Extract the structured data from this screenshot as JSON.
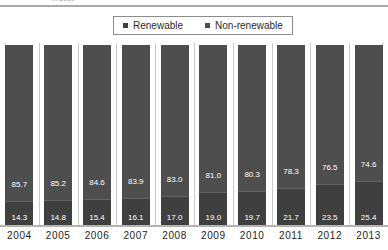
{
  "top_clip": {
    "text": "in 2013"
  },
  "legend": {
    "position": "top-center",
    "entries": [
      {
        "label": "Renewable",
        "color": "#3f3f3f",
        "marker": "square-marker-icon"
      },
      {
        "label": "Non-renewable",
        "color": "#4e4e4e",
        "marker": "square-marker-icon"
      }
    ]
  },
  "chart_data": {
    "type": "bar",
    "subtype": "stacked-percentage-column",
    "title": "",
    "subtitle": "",
    "xlabel": "",
    "ylabel": "",
    "ylim": [
      0,
      100
    ],
    "grid": true,
    "grid_orientation": "vertical",
    "legend_position": "top-center",
    "categories": [
      "2004",
      "2005",
      "2006",
      "2007",
      "2008",
      "2009",
      "2010",
      "2011",
      "2012",
      "2013"
    ],
    "series": [
      {
        "name": "Non-renewable",
        "color": "#4e4e4e",
        "values": [
          85.7,
          85.2,
          84.6,
          83.9,
          83.0,
          81.0,
          80.3,
          78.3,
          76.5,
          74.6
        ]
      },
      {
        "name": "Renewable",
        "color": "#3f3f3f",
        "values": [
          14.3,
          14.8,
          15.4,
          16.1,
          17.0,
          19.0,
          19.7,
          21.7,
          23.5,
          25.4
        ]
      }
    ],
    "data_labels": true,
    "data_label_format": "0.0"
  },
  "colors": {
    "non_renewable": "#4e4e4e",
    "renewable": "#3f3f3f",
    "gridline": "#c9c9c9",
    "axis": "#b4b4b4",
    "legend_border": "#8d8d8d",
    "label_text": "#ffffff",
    "axis_text": "#1d1d1d"
  }
}
